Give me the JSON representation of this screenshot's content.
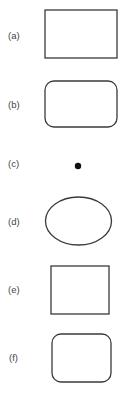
{
  "figure": {
    "items": [
      {
        "label": "(a)",
        "shape": "rectangle"
      },
      {
        "label": "(b)",
        "shape": "rounded-rectangle"
      },
      {
        "label": "(c)",
        "shape": "point"
      },
      {
        "label": "(d)",
        "shape": "ellipse"
      },
      {
        "label": "(e)",
        "shape": "square"
      },
      {
        "label": "(f)",
        "shape": "rounded-square"
      }
    ],
    "colors": {
      "stroke": "#3a3a3a",
      "point": "#111111",
      "label": "#444444",
      "background": "#ffffff"
    }
  }
}
